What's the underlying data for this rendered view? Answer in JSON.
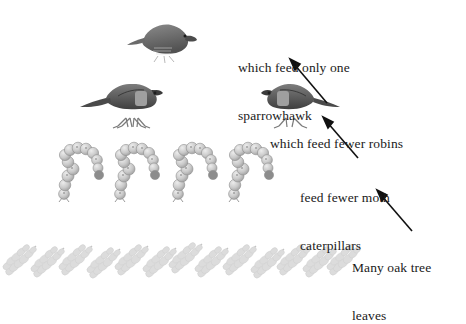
{
  "diagram": {
    "background_color": "#ffffff",
    "text_color": "#1a1a1a"
  },
  "labels": {
    "sparrowhawk_line1": "which feed only one",
    "sparrowhawk_line2": "sparrowhawk",
    "robins": "which feed fewer robins",
    "caterpillars_line1": "feed fewer moth",
    "caterpillars_line2": "caterpillars",
    "leaves_line1": "Many oak tree",
    "leaves_line2": "leaves"
  },
  "organisms": {
    "sparrowhawk": {
      "name": "sparrowhawk",
      "count": 1,
      "color": "#6e6e6e"
    },
    "robins": {
      "name": "robin",
      "count": 2,
      "color": "#555555"
    },
    "caterpillars": {
      "name": "moth caterpillar",
      "count": 4,
      "color": "#a8a8a8"
    },
    "leaves": {
      "name": "oak leaf",
      "count": 13,
      "color": "#d8d8d8"
    }
  },
  "arrows": {
    "to_sparrowhawk": {
      "from_label": "which feed fewer robins",
      "to_label": "sparrowhawk"
    },
    "to_robins": {
      "from_label": "feed fewer moth caterpillars",
      "to_label": "which feed fewer robins"
    },
    "to_caterpillars": {
      "from_label": "Many oak tree leaves",
      "to_label": "caterpillars"
    }
  }
}
